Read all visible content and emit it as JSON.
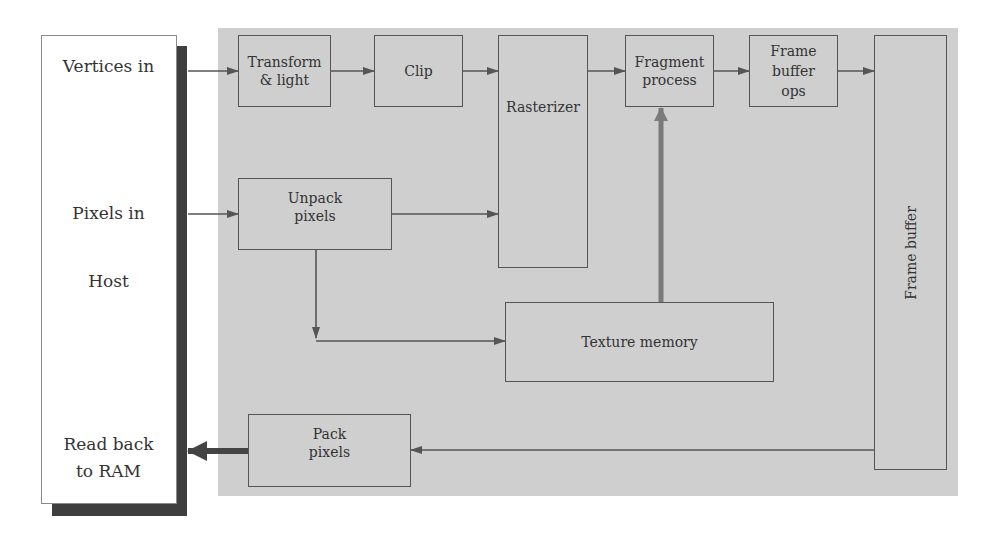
{
  "diagram": {
    "host": {
      "labels": {
        "vertices_in": "Vertices in",
        "pixels_in": "Pixels in",
        "host": "Host",
        "read_back_line1": "Read back",
        "read_back_line2": "to RAM"
      }
    },
    "nodes": {
      "transform_light": {
        "line1": "Transform",
        "line2": "& light"
      },
      "clip": {
        "label": "Clip"
      },
      "rasterizer": {
        "label": "Rasterizer"
      },
      "fragment_process": {
        "line1": "Fragment",
        "line2": "process"
      },
      "frame_buffer_ops": {
        "line1": "Frame",
        "line2": "buffer",
        "line3": "ops"
      },
      "frame_buffer": {
        "label": "Frame buffer"
      },
      "unpack_pixels": {
        "line1": "Unpack",
        "line2": "pixels"
      },
      "texture_memory": {
        "label": "Texture memory"
      },
      "pack_pixels": {
        "line1": "Pack",
        "line2": "pixels"
      }
    },
    "edges": [
      {
        "from": "Vertices in",
        "to": "Transform & light"
      },
      {
        "from": "Transform & light",
        "to": "Clip"
      },
      {
        "from": "Clip",
        "to": "Rasterizer"
      },
      {
        "from": "Rasterizer",
        "to": "Fragment process"
      },
      {
        "from": "Fragment process",
        "to": "Frame buffer ops"
      },
      {
        "from": "Frame buffer ops",
        "to": "Frame buffer"
      },
      {
        "from": "Pixels in",
        "to": "Unpack pixels"
      },
      {
        "from": "Unpack pixels",
        "to": "Rasterizer"
      },
      {
        "from": "Unpack pixels",
        "to": "Texture memory"
      },
      {
        "from": "Texture memory",
        "to": "Fragment process"
      },
      {
        "from": "Frame buffer",
        "to": "Pack pixels"
      },
      {
        "from": "Pack pixels",
        "to": "Read back to RAM"
      }
    ],
    "colors": {
      "panel": "#cfcfcf",
      "host_bg": "#ffffff",
      "shadow": "#3e3e3e",
      "border": "#555555",
      "texture_arrow": "#7a7a7a"
    }
  }
}
